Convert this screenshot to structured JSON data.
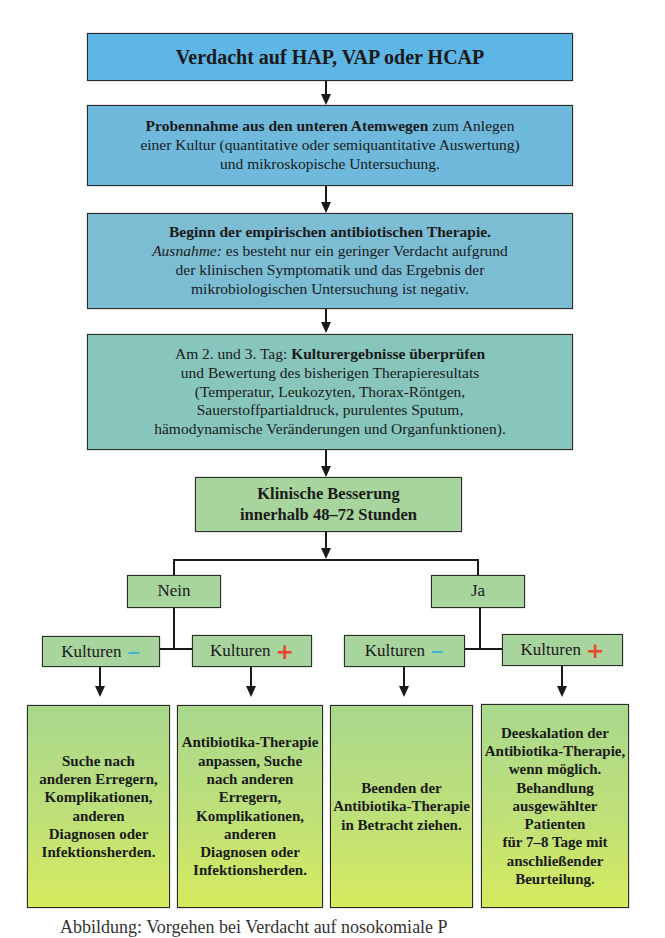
{
  "colors": {
    "box_blue_top": "#5eb6e6",
    "box_blue_mid": "#6fb9dc",
    "box_blue_low": "#7cbdd4",
    "box_teal": "#88c6bd",
    "box_green": "#a8d49e",
    "box_lime_top": "#a9d88c",
    "box_lime_bottom": "#d6eb5e",
    "minus_color": "#3fb2d8",
    "plus_color": "#e8472a",
    "line_color": "#1a1a1a"
  },
  "step1": {
    "title": "Verdacht auf HAP, VAP oder HCAP"
  },
  "step2": {
    "bold": "Probennahme aus den unteren Atemwegen",
    "rest1": " zum Anlegen",
    "line2": "einer Kultur (quantitative oder semiquantitative Auswertung)",
    "line3": "und mikroskopische Untersuchung."
  },
  "step3": {
    "bold": "Beginn der empirischen antibiotischen Therapie.",
    "italic": "Ausnahme:",
    "line2_rest": " es besteht nur ein geringer Verdacht aufgrund",
    "line3": "der klinischen Symptomatik und das Ergebnis der",
    "line4": "mikrobiologischen Untersuchung ist negativ."
  },
  "step4": {
    "prefix": "Am 2. und 3. Tag: ",
    "bold": "Kulturergebnisse überprüfen",
    "line2": "und Bewertung des bisherigen Therapieresultats",
    "line3": "(Temperatur, Leukozyten, Thorax-Röntgen,",
    "line4": "Sauerstoffpartialdruck, purulentes Sputum,",
    "line5": "hämodynamische Veränderungen und Organfunktionen)."
  },
  "step5": {
    "line1": "Klinische Besserung",
    "line2": "innerhalb 48–72 Stunden"
  },
  "branches": {
    "no": {
      "label": "Nein"
    },
    "yes": {
      "label": "Ja"
    }
  },
  "cultures": {
    "label": "Kulturen",
    "minus_sign": "−",
    "plus_sign": "+"
  },
  "outcomes": [
    {
      "lines": [
        "Suche nach",
        "anderen Erregern,",
        "Komplikationen,",
        "anderen",
        "Diagnosen oder",
        "Infektionsherden."
      ]
    },
    {
      "lines": [
        "Antibiotika-Therapie",
        "anpassen, Suche",
        "nach anderen",
        "Erregern,",
        "Komplikationen,",
        "anderen",
        "Diagnosen oder",
        "Infektionsherden."
      ]
    },
    {
      "lines": [
        "Beenden der",
        "Antibiotika-Therapie",
        "in Betracht ziehen."
      ]
    },
    {
      "lines": [
        "Deeskalation der",
        "Antibiotika-Therapie,",
        "wenn möglich.",
        "Behandlung",
        "ausgewählter",
        "Patienten",
        "für 7–8 Tage mit",
        "anschließender",
        "Beurteilung."
      ]
    }
  ],
  "caption": {
    "text": "Abbildung: Vorgehen bei Verdacht auf nosokomiale P"
  }
}
